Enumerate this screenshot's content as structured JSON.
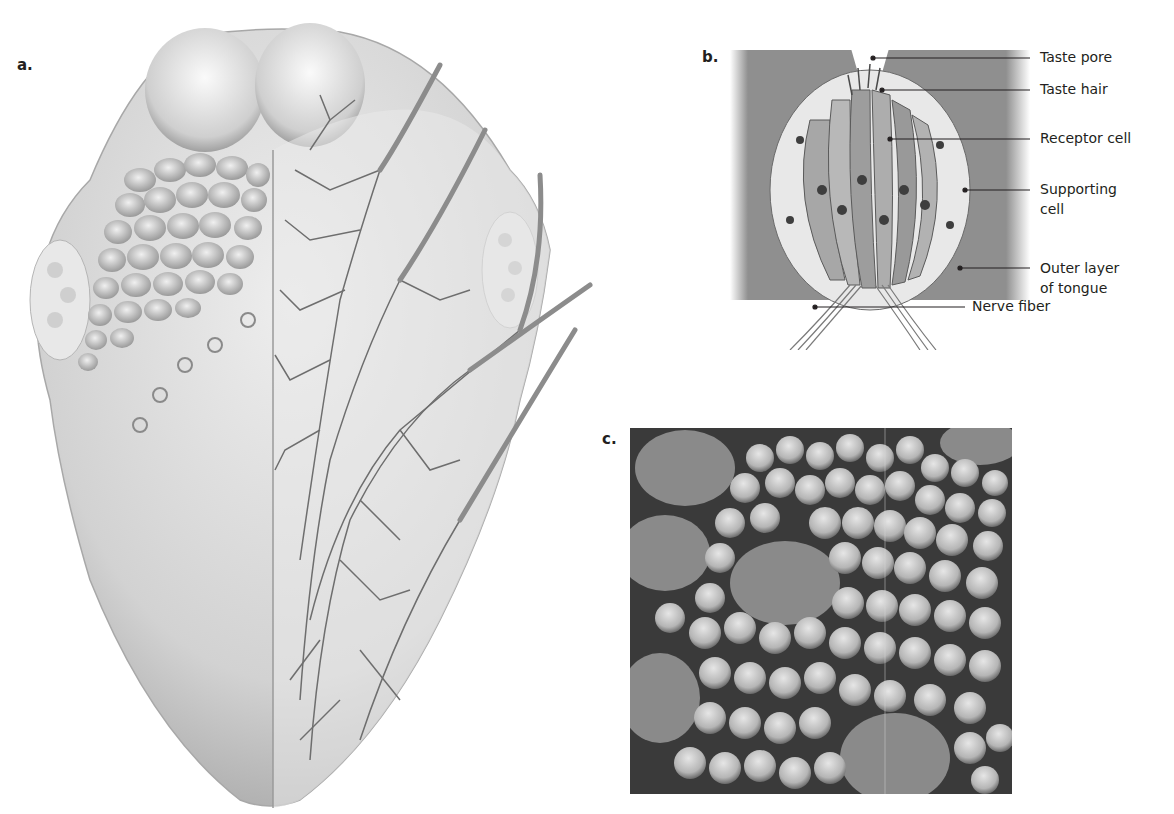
{
  "figure": {
    "panels": [
      {
        "id": "a",
        "label": "a.",
        "description": "Illustration of the human tongue; left half shows papillae surface, right half shows branching nerves"
      },
      {
        "id": "b",
        "label": "b.",
        "description": "Cross-section of a taste bud"
      },
      {
        "id": "c",
        "label": "c.",
        "description": "Scanning electron micrograph of tongue surface papillae"
      }
    ],
    "panel_b_callouts": [
      {
        "text": "Taste pore"
      },
      {
        "text": "Taste hair"
      },
      {
        "text": "Receptor cell"
      },
      {
        "text": "Supporting cell",
        "line1": "Supporting",
        "line2": "cell"
      },
      {
        "text": "Outer layer of tongue",
        "line1": "Outer layer",
        "line2": "of tongue"
      },
      {
        "text": "Nerve fiber"
      }
    ]
  },
  "colors": {
    "tongue_light": "#e6e6e6",
    "tongue_mid": "#c8c8c8",
    "tongue_dark": "#9a9a9a",
    "nerve": "#6e6e6e",
    "tissue": "#8f8f8f",
    "sem_bg": "#3a3a3a",
    "sem_bump": "#bdbdbd",
    "text": "#231f20"
  }
}
